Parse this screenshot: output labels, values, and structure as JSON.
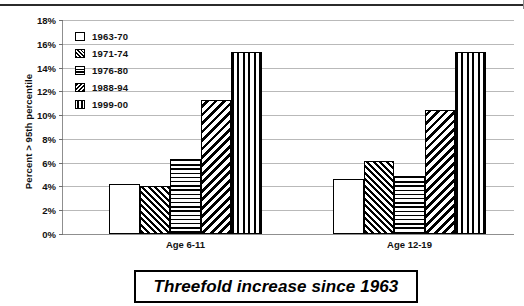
{
  "chart_data": {
    "type": "bar",
    "title": "",
    "xlabel": "",
    "ylabel": "Percent > 95th percentile",
    "ylim": [
      0,
      18
    ],
    "ytick_labels": [
      "0%",
      "2%",
      "4%",
      "6%",
      "8%",
      "10%",
      "12%",
      "14%",
      "16%",
      "18%"
    ],
    "ytick_values": [
      0,
      2,
      4,
      6,
      8,
      10,
      12,
      14,
      16,
      18
    ],
    "grid": true,
    "legend_position": "top-left-inside",
    "categories": [
      "Age 6-11",
      "Age 12-19"
    ],
    "series": [
      {
        "name": "1963-70",
        "pattern": "solid-white",
        "values": [
          4.2,
          4.6
        ]
      },
      {
        "name": "1971-74",
        "pattern": "diagonal-back",
        "values": [
          4.0,
          6.1
        ]
      },
      {
        "name": "1976-80",
        "pattern": "horizontal",
        "values": [
          6.3,
          4.9
        ]
      },
      {
        "name": "1988-94",
        "pattern": "diagonal-fwd",
        "values": [
          11.3,
          10.4
        ]
      },
      {
        "name": "1999-00",
        "pattern": "vertical",
        "values": [
          15.3,
          15.3
        ]
      }
    ],
    "annotations": [
      {
        "text": "Threefold increase since 1963",
        "style": "italic-boxed",
        "position": "below-axis"
      }
    ]
  },
  "caption": {
    "text": "Threefold increase since 1963"
  }
}
